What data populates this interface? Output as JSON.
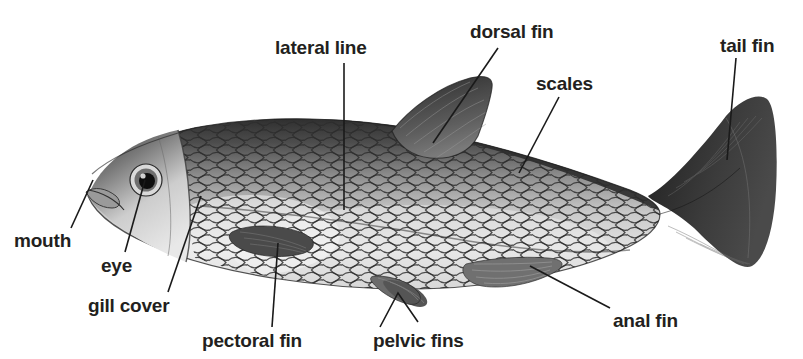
{
  "figure": {
    "background_color": "#ffffff",
    "label_color": "#231f20",
    "leader_color": "#1a1a1a",
    "width": 803,
    "height": 359,
    "cropped_top_text": ""
  },
  "labels": {
    "lateral_line": "lateral line",
    "dorsal_fin": "dorsal fin",
    "scales": "scales",
    "tail_fin": "tail fin",
    "mouth": "mouth",
    "eye": "eye",
    "gill_cover": "gill cover",
    "pectoral_fin": "pectoral fin",
    "pelvic_fins": "pelvic fins",
    "anal_fin": "anal fin"
  },
  "parts": [
    {
      "name": "lateral line",
      "label_x": 275,
      "label_y": 38,
      "point_x": 344,
      "point_y": 210
    },
    {
      "name": "dorsal fin",
      "label_x": 470,
      "label_y": 22,
      "point_x": 433,
      "point_y": 143
    },
    {
      "name": "scales",
      "label_x": 536,
      "label_y": 74,
      "point_x": 519,
      "point_y": 173
    },
    {
      "name": "tail fin",
      "label_x": 720,
      "label_y": 36,
      "point_x": 727,
      "point_y": 160
    },
    {
      "name": "mouth",
      "label_x": 14,
      "label_y": 231,
      "point_x": 92,
      "point_y": 180
    },
    {
      "name": "eye",
      "label_x": 101,
      "label_y": 256,
      "point_x": 144,
      "point_y": 179
    },
    {
      "name": "gill cover",
      "label_x": 88,
      "label_y": 296,
      "point_x": 201,
      "point_y": 196
    },
    {
      "name": "pectoral fin",
      "label_x": 202,
      "label_y": 331,
      "point_x": 278,
      "point_y": 243
    },
    {
      "name": "pelvic fins",
      "label_x": 373,
      "label_y": 331,
      "point_x": 395,
      "point_y": 292
    },
    {
      "name": "anal fin",
      "label_x": 613,
      "label_y": 311,
      "point_x": 530,
      "point_y": 266
    }
  ]
}
